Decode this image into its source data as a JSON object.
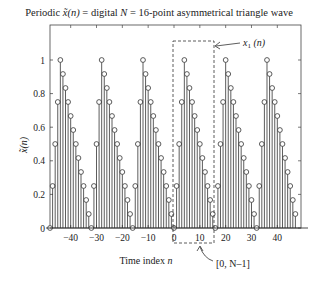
{
  "chart_data": {
    "type": "stem",
    "title": "Periodic x̃(n) = digital N = 16-point asymmetrical triangle wave",
    "title_parts": {
      "pre": "Periodic ",
      "sym": "x̃(n)",
      "mid": " = digital ",
      "N": "N",
      "post": " = 16-point asymmetrical triangle wave"
    },
    "xlabel": "Time index n",
    "ylabel": "x̃(n)",
    "xlim": [
      -48,
      47
    ],
    "ylim": [
      0,
      1.2
    ],
    "x_ticks": [
      -40,
      -30,
      -20,
      -10,
      0,
      10,
      20,
      30,
      40
    ],
    "y_ticks": [
      0,
      0.2,
      0.4,
      0.6,
      0.8,
      1
    ],
    "y_tick_labels": [
      "0",
      "0.2",
      "0.4",
      "0.6",
      "0.8",
      "1"
    ],
    "period": 16,
    "one_period_values": [
      0,
      0.25,
      0.5,
      0.75,
      1,
      0.9167,
      0.8333,
      0.75,
      0.6667,
      0.5833,
      0.5,
      0.4167,
      0.3333,
      0.25,
      0.1667,
      0.0833
    ],
    "n_range": [
      -48,
      47
    ],
    "annotations": [
      {
        "text": "x₁ (n)",
        "target": "dashed box around one period n=0..15"
      },
      {
        "text": "[0, N–1]",
        "target": "x-axis interval 0..15"
      }
    ]
  },
  "labels": {
    "title_pre": "Periodic ",
    "title_post": " = digital ",
    "title_N": "N",
    "title_end": " = 16-point asymmetrical triangle wave",
    "xlabel": "Time index ",
    "xlabel_n": "n",
    "x1": "x",
    "x1_sub": "1",
    "x1_n": " (n)",
    "interval": "[0, N–1]"
  }
}
